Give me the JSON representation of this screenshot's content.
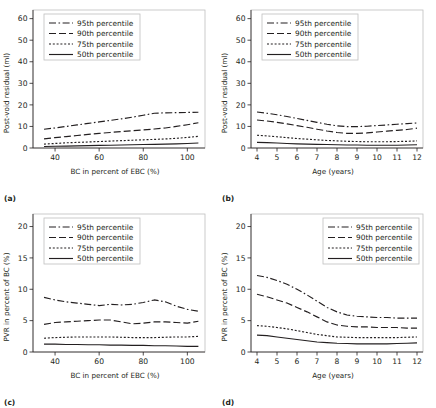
{
  "figure": {
    "panels": [
      {
        "id": "a",
        "label": "(a)",
        "chart_data": {
          "type": "line",
          "title": "",
          "xlabel": "BC in percent of EBC (%)",
          "ylabel": "Post-void residual (ml)",
          "xlim": [
            30,
            108
          ],
          "ylim": [
            0,
            64
          ],
          "xticks": [
            40,
            60,
            80,
            100
          ],
          "yticks": [
            0,
            10,
            20,
            30,
            40,
            50,
            60
          ],
          "grid": false,
          "legend_position": "top-left",
          "x": [
            35,
            40,
            45,
            50,
            55,
            60,
            65,
            70,
            75,
            80,
            85,
            90,
            95,
            100,
            105
          ],
          "series": [
            {
              "name": "95th percentile",
              "style": "dash-dot",
              "values": [
                8.7,
                9.3,
                10.0,
                10.7,
                11.4,
                12.1,
                12.8,
                13.5,
                14.3,
                15.2,
                16.1,
                16.3,
                16.4,
                16.5,
                16.6
              ]
            },
            {
              "name": "90th percentile",
              "style": "long-dash",
              "values": [
                4.2,
                4.8,
                5.3,
                5.8,
                6.3,
                6.8,
                7.2,
                7.6,
                8.0,
                8.4,
                8.8,
                9.3,
                10.0,
                10.8,
                11.7
              ]
            },
            {
              "name": "75th percentile",
              "style": "dotted",
              "values": [
                1.8,
                2.1,
                2.4,
                2.6,
                2.8,
                3.0,
                3.2,
                3.4,
                3.6,
                3.8,
                4.0,
                4.2,
                4.5,
                4.9,
                5.4
              ]
            },
            {
              "name": "50th percentile",
              "style": "solid",
              "values": [
                0.7,
                0.8,
                0.9,
                1.0,
                1.1,
                1.2,
                1.3,
                1.4,
                1.5,
                1.6,
                1.7,
                1.8,
                1.9,
                2.1,
                2.3
              ]
            }
          ]
        }
      },
      {
        "id": "b",
        "label": "(b)",
        "chart_data": {
          "type": "line",
          "title": "",
          "xlabel": "Age (years)",
          "ylabel": "Post-void residual (ml)",
          "xlim": [
            3.7,
            12.3
          ],
          "ylim": [
            0,
            64
          ],
          "xticks": [
            4,
            5,
            6,
            7,
            8,
            9,
            10,
            11,
            12
          ],
          "yticks": [
            0,
            10,
            20,
            30,
            40,
            50,
            60
          ],
          "grid": false,
          "legend_position": "top-left",
          "x": [
            4,
            4.5,
            5,
            5.5,
            6,
            6.5,
            7,
            7.5,
            8,
            8.5,
            9,
            9.5,
            10,
            10.5,
            11,
            11.5,
            12
          ],
          "series": [
            {
              "name": "95th percentile",
              "style": "dash-dot",
              "values": [
                16.7,
                16.1,
                15.4,
                14.6,
                13.7,
                12.8,
                11.9,
                11.0,
                10.3,
                9.9,
                9.9,
                10.1,
                10.4,
                10.7,
                11.0,
                11.3,
                11.6
              ]
            },
            {
              "name": "90th percentile",
              "style": "long-dash",
              "values": [
                13.0,
                12.5,
                11.9,
                11.2,
                10.4,
                9.6,
                8.7,
                7.9,
                7.2,
                6.8,
                6.8,
                7.0,
                7.4,
                7.8,
                8.2,
                8.6,
                9.2
              ]
            },
            {
              "name": "75th percentile",
              "style": "dotted",
              "values": [
                5.9,
                5.6,
                5.2,
                4.8,
                4.4,
                4.1,
                3.8,
                3.5,
                3.3,
                3.1,
                3.0,
                2.9,
                2.9,
                2.9,
                3.0,
                3.1,
                3.3
              ]
            },
            {
              "name": "50th percentile",
              "style": "solid",
              "values": [
                2.6,
                2.5,
                2.3,
                2.1,
                1.9,
                1.8,
                1.7,
                1.6,
                1.5,
                1.4,
                1.4,
                1.3,
                1.3,
                1.3,
                1.3,
                1.4,
                1.5
              ]
            }
          ]
        }
      },
      {
        "id": "c",
        "label": "(c)",
        "chart_data": {
          "type": "line",
          "title": "",
          "xlabel": "BC in percent of EBC (%)",
          "ylabel": "PVR in percent of BC (%)",
          "xlim": [
            30,
            108
          ],
          "ylim": [
            0,
            22
          ],
          "xticks": [
            40,
            60,
            80,
            100
          ],
          "yticks": [
            0,
            5,
            10,
            15,
            20
          ],
          "grid": false,
          "legend_position": "top-left",
          "x": [
            35,
            40,
            45,
            50,
            55,
            60,
            65,
            70,
            75,
            80,
            85,
            90,
            95,
            100,
            105
          ],
          "series": [
            {
              "name": "95th percentile",
              "style": "dash-dot",
              "values": [
                8.7,
                8.3,
                8.0,
                7.8,
                7.6,
                7.4,
                7.6,
                7.5,
                7.6,
                7.9,
                8.3,
                8.0,
                7.3,
                6.8,
                6.5
              ]
            },
            {
              "name": "90th percentile",
              "style": "long-dash",
              "values": [
                4.4,
                4.7,
                4.8,
                4.9,
                5.0,
                5.1,
                5.1,
                4.8,
                4.5,
                4.6,
                4.8,
                4.8,
                4.7,
                4.6,
                4.9
              ]
            },
            {
              "name": "75th percentile",
              "style": "dotted",
              "values": [
                2.2,
                2.3,
                2.35,
                2.4,
                2.4,
                2.4,
                2.4,
                2.35,
                2.3,
                2.3,
                2.3,
                2.35,
                2.4,
                2.4,
                2.5
              ]
            },
            {
              "name": "50th percentile",
              "style": "solid",
              "values": [
                1.25,
                1.25,
                1.2,
                1.2,
                1.15,
                1.15,
                1.1,
                1.1,
                1.05,
                1.05,
                1.0,
                1.0,
                0.95,
                0.9,
                0.9
              ]
            }
          ]
        }
      },
      {
        "id": "d",
        "label": "(d)",
        "chart_data": {
          "type": "line",
          "title": "",
          "xlabel": "Age (years)",
          "ylabel": "PVR in percent of BC (%)",
          "xlim": [
            3.7,
            12.3
          ],
          "ylim": [
            0,
            22
          ],
          "xticks": [
            4,
            5,
            6,
            7,
            8,
            9,
            10,
            11,
            12
          ],
          "yticks": [
            0,
            5,
            10,
            15,
            20
          ],
          "grid": false,
          "legend_position": "top-right",
          "x": [
            4,
            4.5,
            5,
            5.5,
            6,
            6.5,
            7,
            7.5,
            8,
            8.5,
            9,
            9.5,
            10,
            10.5,
            11,
            11.5,
            12
          ],
          "series": [
            {
              "name": "95th percentile",
              "style": "dash-dot",
              "values": [
                12.2,
                11.9,
                11.4,
                10.8,
                10.0,
                9.1,
                8.1,
                7.1,
                6.4,
                5.9,
                5.7,
                5.6,
                5.5,
                5.5,
                5.4,
                5.4,
                5.4
              ]
            },
            {
              "name": "90th percentile",
              "style": "long-dash",
              "values": [
                9.2,
                8.8,
                8.3,
                7.8,
                7.1,
                6.4,
                5.6,
                4.8,
                4.3,
                4.1,
                4.0,
                4.0,
                3.9,
                3.9,
                3.9,
                3.8,
                3.8
              ]
            },
            {
              "name": "75th percentile",
              "style": "dotted",
              "values": [
                4.2,
                4.1,
                3.9,
                3.7,
                3.4,
                3.1,
                2.8,
                2.6,
                2.4,
                2.35,
                2.3,
                2.3,
                2.3,
                2.3,
                2.3,
                2.35,
                2.4
              ]
            },
            {
              "name": "50th percentile",
              "style": "solid",
              "values": [
                2.7,
                2.6,
                2.4,
                2.2,
                2.0,
                1.8,
                1.6,
                1.5,
                1.4,
                1.35,
                1.3,
                1.3,
                1.3,
                1.3,
                1.35,
                1.4,
                1.45
              ]
            }
          ]
        }
      }
    ],
    "legend_entries": [
      {
        "label": "95th percentile",
        "style": "dash-dot"
      },
      {
        "label": "90th percentile",
        "style": "long-dash"
      },
      {
        "label": "75th percentile",
        "style": "dotted"
      },
      {
        "label": "50th percentile",
        "style": "solid"
      }
    ],
    "colors": {
      "ink": "#231f20",
      "frame": "#bfbfbf",
      "background": "#ffffff"
    }
  }
}
